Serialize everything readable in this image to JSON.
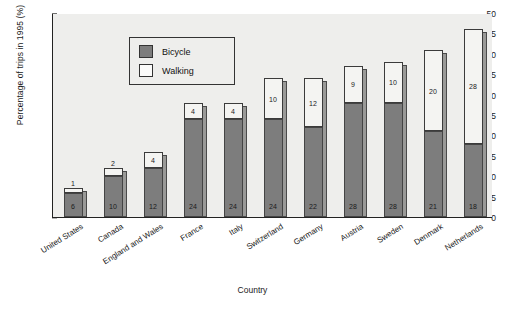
{
  "chart_data": {
    "type": "bar",
    "subtype": "stacked-vertical",
    "title": "",
    "xlabel": "Country",
    "ylabel": "Percentage of trips in 1995 (%)",
    "ylim": [
      0,
      50
    ],
    "ytick_step": 5,
    "yticks": [
      0,
      5,
      10,
      15,
      20,
      25,
      30,
      35,
      40,
      45,
      50
    ],
    "ytick_labels": [
      "0",
      "5",
      "10",
      "15",
      "20",
      "25",
      "30",
      "35",
      "40",
      "45",
      "50"
    ],
    "grid": false,
    "legend_position": "upper-left-inside",
    "categories": [
      "United States",
      "Canada",
      "England and Wales",
      "France",
      "Italy",
      "Switzerland",
      "Germany",
      "Austria",
      "Sweden",
      "Denmark",
      "Netherlands"
    ],
    "series": [
      {
        "name": "Bicycle",
        "color": "#7d7d7d",
        "values": [
          6,
          10,
          12,
          24,
          24,
          24,
          22,
          28,
          28,
          21,
          18
        ]
      },
      {
        "name": "Walking",
        "color": "#f4f4f2",
        "values": [
          1,
          2,
          4,
          4,
          4,
          10,
          12,
          9,
          10,
          20,
          28
        ]
      }
    ],
    "totals": [
      7,
      12,
      16,
      28,
      28,
      34,
      34,
      37,
      38,
      41,
      46
    ],
    "value_labels_shown": true
  },
  "legend": {
    "entries": [
      {
        "label": "Bicycle",
        "swatch": "dark-gray"
      },
      {
        "label": "Walking",
        "swatch": "white"
      }
    ]
  },
  "caption": ""
}
